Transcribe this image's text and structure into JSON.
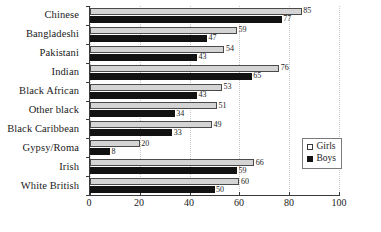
{
  "chart_data": {
    "type": "bar",
    "orientation": "horizontal",
    "title": "",
    "xlabel": "",
    "ylabel": "",
    "xlim": [
      0,
      100
    ],
    "xticks": [
      0,
      20,
      40,
      60,
      80,
      100
    ],
    "grid": "vertical-dotted",
    "legend_position": "center-right",
    "categories": [
      "Chinese",
      "Bangladeshi",
      "Pakistani",
      "Indian",
      "Black African",
      "Other black",
      "Black Caribbean",
      "Gypsy/Roma",
      "Irish",
      "White British"
    ],
    "series": [
      {
        "name": "Girls",
        "color": "#d4d4d4",
        "values": [
          85,
          59,
          54,
          76,
          53,
          51,
          49,
          20,
          66,
          60
        ]
      },
      {
        "name": "Boys",
        "color": "#121212",
        "values": [
          77,
          47,
          43,
          65,
          43,
          34,
          33,
          8,
          59,
          50
        ]
      }
    ]
  },
  "legend": {
    "entries": [
      {
        "label": "Girls"
      },
      {
        "label": "Boys"
      }
    ]
  }
}
